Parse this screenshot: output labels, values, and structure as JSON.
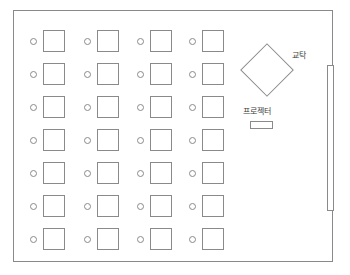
{
  "diagram": {
    "room": {
      "x": 13,
      "y": 10,
      "width": 320,
      "height": 252,
      "border_color": "#8a8a8a",
      "fill_color": "#ffffff"
    },
    "seating": {
      "rows": 7,
      "columns": 4,
      "total_seats": 28,
      "column_x": [
        30,
        84,
        137,
        189
      ],
      "row_y": [
        30,
        63,
        96,
        129,
        162,
        195,
        228
      ],
      "chair_shape": "circle",
      "chair_diameter": 7,
      "desk_shape": "square",
      "desk_size": 22,
      "stroke_color": "#8a8a8a"
    },
    "fixtures": [
      {
        "id": "podium",
        "label": "교탁",
        "shape": "rotated-square",
        "x": 248,
        "y": 51,
        "size": 38,
        "rotation": 45,
        "label_x": 292,
        "label_y": 52
      },
      {
        "id": "projector",
        "label": "프로젝터",
        "shape": "rectangle",
        "x": 250,
        "y": 121,
        "width": 23,
        "height": 8,
        "label_x": 243,
        "label_y": 108
      },
      {
        "id": "wall-fixture",
        "label": "",
        "shape": "rectangle",
        "x": 327,
        "y": 65,
        "width": 7,
        "height": 146
      }
    ],
    "colors": {
      "stroke": "#8a8a8a",
      "text": "#3d3d3d",
      "background": "#ffffff"
    }
  }
}
